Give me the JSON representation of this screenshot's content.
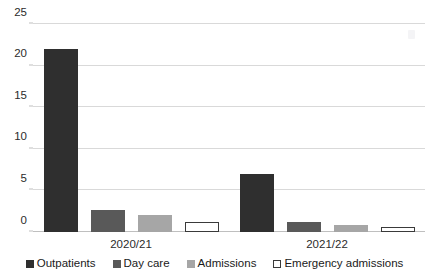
{
  "chart_data": {
    "type": "bar",
    "title": "",
    "subtitle": "",
    "xlabel": "",
    "ylabel": "",
    "categories": [
      "2020/21",
      "2021/22"
    ],
    "series": [
      {
        "name": "Outpatients",
        "color": "#2f2f2f",
        "marker": "filled-square",
        "values": [
          22,
          7
        ]
      },
      {
        "name": "Day care",
        "color": "#595959",
        "marker": "filled-square",
        "values": [
          2.7,
          1.2
        ]
      },
      {
        "name": "Admissions",
        "color": "#a6a6a6",
        "marker": "filled-square",
        "values": [
          2.1,
          0.9
        ]
      },
      {
        "name": "Emergency admissions",
        "color": "#ffffff",
        "marker": "hollow-square",
        "values": [
          1.2,
          0.6
        ]
      }
    ],
    "ylim": [
      0,
      25
    ],
    "yticks": [
      0,
      5,
      10,
      15,
      20,
      25
    ],
    "ytick_labels": [
      "0",
      "5",
      "10",
      "15",
      "20",
      "25"
    ],
    "grid": true,
    "grid_axis": "y",
    "legend_position": "bottom",
    "gridline_color": "#d9d9d9",
    "axis_color": "#bfbfbf",
    "background": "#ffffff"
  }
}
